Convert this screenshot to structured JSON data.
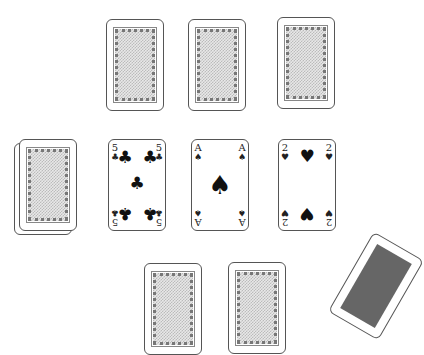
{
  "game": {
    "type": "card-game",
    "top_row": [
      {
        "id": "opponent-card-1",
        "face": "down"
      },
      {
        "id": "opponent-card-2",
        "face": "down"
      },
      {
        "id": "opponent-card-3",
        "face": "down"
      }
    ],
    "deck": {
      "face": "down",
      "label": "deck"
    },
    "table_cards": [
      {
        "rank": "5",
        "suit": "♣",
        "suit_name": "clubs"
      },
      {
        "rank": "A",
        "suit": "♠",
        "suit_name": "spades"
      },
      {
        "rank": "2",
        "suit": "♥",
        "suit_name": "hearts"
      }
    ],
    "bottom_row": [
      {
        "id": "player-card-1",
        "face": "down"
      },
      {
        "id": "player-card-2",
        "face": "down"
      }
    ],
    "moving_card": {
      "face": "up",
      "partially_visible": true
    }
  },
  "colors": {
    "card_border": "#555555",
    "background": "#ffffff",
    "ink": "#111111"
  }
}
